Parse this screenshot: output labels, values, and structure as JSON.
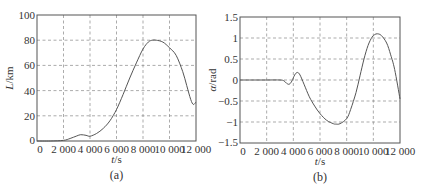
{
  "chart_data": [
    {
      "type": "line",
      "caption": "(a)",
      "title": "",
      "xlabel": "t/s",
      "ylabel": "L/km",
      "xlim": [
        0,
        12000
      ],
      "ylim": [
        0,
        100
      ],
      "xticks": [
        0,
        2000,
        4000,
        6000,
        8000,
        10000,
        12000
      ],
      "xtick_labels": [
        "0",
        "2 000",
        "4 000",
        "6 000",
        "8 000",
        "10 000",
        "12 000"
      ],
      "yticks": [
        0,
        20,
        40,
        60,
        80,
        100
      ],
      "ytick_labels": [
        "0",
        "20",
        "40",
        "60",
        "80",
        "100"
      ],
      "grid": true,
      "series": [
        {
          "name": "L",
          "x": [
            0,
            1000,
            2000,
            2500,
            3000,
            3300,
            3700,
            4000,
            4500,
            5000,
            5500,
            6000,
            6500,
            7000,
            7500,
            8000,
            8400,
            8700,
            9000,
            9500,
            10000,
            10500,
            11000,
            11300,
            11600,
            11800,
            12000
          ],
          "y": [
            0,
            0,
            0.5,
            2,
            4,
            5,
            4.5,
            3.8,
            6,
            10,
            16,
            25,
            37,
            50,
            62,
            73,
            78.5,
            80,
            80,
            78.5,
            74,
            68,
            55,
            44,
            33,
            29,
            31
          ]
        }
      ]
    },
    {
      "type": "line",
      "caption": "(b)",
      "title": "",
      "xlabel": "t/s",
      "ylabel": "α/rad",
      "xlim": [
        0,
        12000
      ],
      "ylim": [
        -1.5,
        1.5
      ],
      "xticks": [
        0,
        2000,
        4000,
        6000,
        8000,
        10000,
        12000
      ],
      "xtick_labels": [
        "0",
        "2 000",
        "4 000",
        "6 000",
        "8 000",
        "10 000",
        "12 000"
      ],
      "yticks": [
        -1.5,
        -1,
        -0.5,
        0,
        0.5,
        1,
        1.5
      ],
      "ytick_labels": [
        "−1.5",
        "−1",
        "−0.5",
        "0",
        "0.5",
        "1",
        "1.5"
      ],
      "grid": true,
      "series": [
        {
          "name": "alpha",
          "x": [
            0,
            1000,
            2000,
            3000,
            3300,
            3500,
            3700,
            3900,
            4100,
            4300,
            4500,
            4800,
            5200,
            5600,
            6000,
            6500,
            7000,
            7200,
            7500,
            8000,
            8300,
            8700,
            9000,
            9300,
            9600,
            9900,
            10100,
            10300,
            10600,
            11000,
            11300,
            11600,
            12000
          ],
          "y": [
            0,
            0,
            0,
            0,
            -0.02,
            -0.08,
            -0.1,
            -0.02,
            0.12,
            0.18,
            0.12,
            -0.1,
            -0.4,
            -0.62,
            -0.8,
            -0.96,
            -1.04,
            -1.05,
            -1.04,
            -0.92,
            -0.7,
            -0.3,
            0.1,
            0.5,
            0.82,
            1.02,
            1.08,
            1.1,
            1.06,
            0.88,
            0.6,
            0.25,
            -0.45
          ]
        }
      ]
    }
  ]
}
